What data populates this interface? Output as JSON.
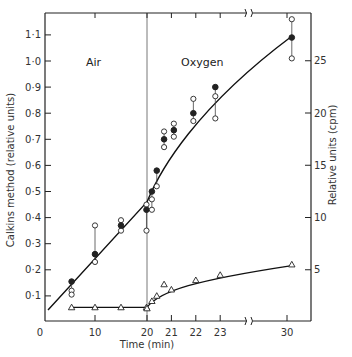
{
  "chart_data": {
    "type": "scatter",
    "title": "",
    "xlabel": "Time (min)",
    "ylabel_left": "Calkins method (relative units)",
    "ylabel_right": "Relative units (cpm)",
    "x_ticks": [
      "0",
      "10",
      "20",
      "21",
      "22",
      "23",
      "30"
    ],
    "y_left_ticks": [
      "0·1",
      "0·2",
      "0·3",
      "0·4",
      "0·5",
      "0·6",
      "0·7",
      "0·8",
      "0·9",
      "1·0",
      "1·1"
    ],
    "y_right_ticks": [
      "5",
      "10",
      "15",
      "20",
      "25"
    ],
    "ylim_left": [
      0,
      1.2
    ],
    "ylim_right": [
      0,
      29
    ],
    "axis_break_x": "between 23 and 30",
    "annotations": [
      {
        "text": "Air",
        "region": "t < 20"
      },
      {
        "text": "Oxygen",
        "region": "t > 20"
      }
    ],
    "grid": false,
    "series": [
      {
        "name": "Calkins method (mean, filled circles; open circles = replicates)",
        "axis": "left",
        "marker": "circle",
        "points": [
          {
            "t": 5.5,
            "mean": 0.155,
            "replicates": [
              0.12,
              0.105
            ]
          },
          {
            "t": 10,
            "mean": 0.26,
            "replicates": [
              0.37,
              0.23
            ]
          },
          {
            "t": 15,
            "mean": 0.37,
            "replicates": [
              0.39,
              0.35
            ]
          },
          {
            "t": 19.9,
            "mean": 0.43,
            "replicates": [
              0.45,
              0.35
            ]
          },
          {
            "t": 20.2,
            "mean": 0.5,
            "replicates": [
              0.47,
              0.43
            ]
          },
          {
            "t": 20.4,
            "mean": 0.58,
            "replicates": [
              0.52
            ]
          },
          {
            "t": 20.7,
            "mean": 0.7,
            "replicates": [
              0.73,
              0.67
            ]
          },
          {
            "t": 21.1,
            "mean": 0.735,
            "replicates": [
              0.76,
              0.71
            ]
          },
          {
            "t": 21.9,
            "mean": 0.8,
            "replicates": [
              0.855,
              0.77
            ]
          },
          {
            "t": 22.8,
            "mean": 0.9,
            "replicates": [
              0.865,
              0.78
            ]
          },
          {
            "t": 30.2,
            "mean": 1.09,
            "replicates": [
              1.16,
              1.01
            ]
          }
        ]
      },
      {
        "name": "Relative units (cpm)",
        "axis": "right",
        "marker": "triangle",
        "points": [
          {
            "t": 5.5,
            "cpm": 1.4
          },
          {
            "t": 10,
            "cpm": 1.4
          },
          {
            "t": 15,
            "cpm": 1.4
          },
          {
            "t": 19.9,
            "cpm": 1.4
          },
          {
            "t": 20.0,
            "cpm": 1.3
          },
          {
            "t": 20.2,
            "cpm": 2.0
          },
          {
            "t": 20.4,
            "cpm": 2.5
          },
          {
            "t": 20.7,
            "cpm": 3.6
          },
          {
            "t": 21.0,
            "cpm": 3.1
          },
          {
            "t": 22.0,
            "cpm": 4.0
          },
          {
            "t": 23.0,
            "cpm": 4.5
          },
          {
            "t": 30.2,
            "cpm": 5.5
          }
        ]
      }
    ]
  }
}
